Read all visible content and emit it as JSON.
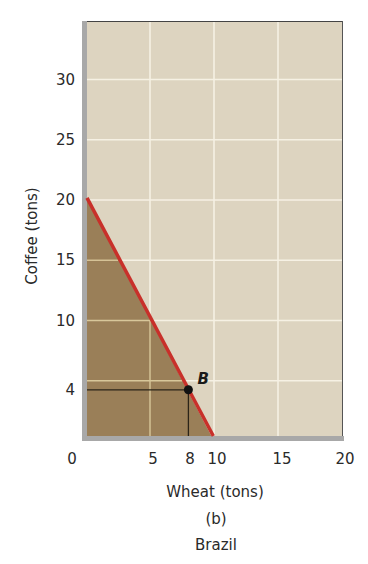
{
  "chart_data": {
    "type": "line",
    "title": "",
    "panel_label": "(b)",
    "caption": "Brazil",
    "xlabel": "Wheat (tons)",
    "ylabel": "Coffee (tons)",
    "xlim": [
      0,
      20
    ],
    "ylim": [
      0,
      35
    ],
    "x_ticks": [
      0,
      5,
      8,
      10,
      15,
      20
    ],
    "x_tick_labels": [
      "0",
      "5",
      "8",
      "10",
      "15",
      "20"
    ],
    "y_ticks": [
      4,
      10,
      15,
      20,
      25,
      30
    ],
    "y_tick_labels": [
      "4",
      "10",
      "15",
      "20",
      "25",
      "30"
    ],
    "grid": true,
    "series": [
      {
        "name": "Production possibilities frontier",
        "x": [
          0,
          10
        ],
        "y": [
          20,
          0
        ],
        "color": "#c8302a"
      }
    ],
    "shaded_region": {
      "description": "Feasible production set under the frontier",
      "vertices": [
        [
          0,
          0
        ],
        [
          0,
          20
        ],
        [
          10,
          0
        ]
      ],
      "color": "#9a7f58"
    },
    "points": [
      {
        "label": "B",
        "x": 8,
        "y": 4,
        "guides": true
      }
    ]
  },
  "colors": {
    "plot_background": "#ddd4c0",
    "grid": "#f6f1e4",
    "fill": "#9a7f58",
    "frontier": "#c8302a",
    "axis_band": "#a9a9a9"
  }
}
